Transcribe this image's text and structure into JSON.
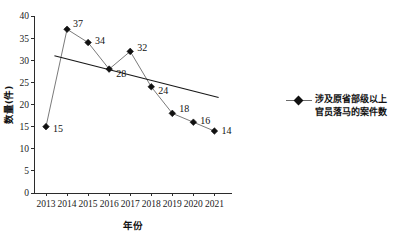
{
  "chart_data": {
    "type": "line",
    "title": "",
    "xlabel": "年份",
    "ylabel": "数量(件)",
    "categories": [
      "2013",
      "2014",
      "2015",
      "2016",
      "2017",
      "2018",
      "2019",
      "2020",
      "2021"
    ],
    "values": [
      15,
      37,
      34,
      28,
      32,
      24,
      18,
      16,
      14
    ],
    "point_labels": [
      "15",
      "37",
      "34",
      "28",
      "32",
      "24",
      "18",
      "16",
      "14"
    ],
    "ylim": [
      0,
      40
    ],
    "y_ticks": [
      "0",
      "5",
      "10",
      "15",
      "20",
      "25",
      "30",
      "35",
      "40"
    ],
    "x_ticks": [
      "2013",
      "2014",
      "2015",
      "2016",
      "2017",
      "2018",
      "2019",
      "2020",
      "2021"
    ],
    "grid": false,
    "legend_position": "right",
    "series": [
      {
        "name": "涉及原省部级以上官员落马的案件数",
        "name_line1": "涉及原省部级以上",
        "name_line2": "官员落马的案件数",
        "marker": "diamond",
        "values": [
          15,
          37,
          34,
          28,
          32,
          24,
          18,
          16,
          14
        ]
      }
    ],
    "trendline": {
      "type": "linear",
      "x_start": 2013.4,
      "y_start": 31.0,
      "x_end": 2021.2,
      "y_end": 21.6
    },
    "colors": {
      "series_line": "#6b6b6b",
      "marker": "#111111",
      "trend_line": "#171717",
      "axis": "#2b2b2b",
      "text": "#1a1a1a",
      "background": "#ffffff"
    }
  },
  "legend": {
    "line1": "涉及原省部级以上",
    "line2": "官员落马的案件数"
  },
  "axes": {
    "x_title": "年份",
    "y_title": "数量(件)"
  }
}
